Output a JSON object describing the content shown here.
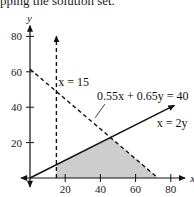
{
  "caption": "pping the solution set.",
  "chart_data": {
    "type": "area",
    "title": "",
    "xlabel": "x",
    "ylabel": "y",
    "xlim": [
      -5,
      90
    ],
    "ylim": [
      -5,
      90
    ],
    "xticks": [
      20,
      40,
      60,
      80
    ],
    "yticks": [
      20,
      40,
      60,
      80
    ],
    "xtick_labels": [
      "20",
      "40",
      "60",
      "80"
    ],
    "ytick_labels": [
      "20",
      "40",
      "60",
      "80"
    ],
    "grid": false,
    "lines": [
      {
        "name": "x = 15",
        "equation": "x = 15",
        "style": "dashed",
        "points": [
          [
            15,
            0
          ],
          [
            15,
            80
          ]
        ],
        "arrow": "end"
      },
      {
        "name": "0.55x + 0.65y = 40",
        "equation": "0.55x + 0.65y = 40",
        "style": "dashed",
        "points": [
          [
            0,
            61.54
          ],
          [
            72.73,
            0
          ]
        ]
      },
      {
        "name": "x = 2y",
        "equation": "x = 2y",
        "style": "solid",
        "points": [
          [
            0,
            0
          ],
          [
            82,
            41
          ]
        ],
        "arrow": "end"
      }
    ],
    "shaded_region": {
      "name": "solution set",
      "vertices": [
        [
          15,
          0
        ],
        [
          15,
          7.5
        ],
        [
          45.71,
          22.86
        ],
        [
          72.73,
          0
        ]
      ],
      "color": "#c8c8c8"
    },
    "annotations": [
      {
        "text": "x = 15",
        "anchor": [
          16,
          52
        ]
      },
      {
        "text": "0.55x + 0.65y = 40",
        "anchor": [
          38,
          44
        ]
      },
      {
        "text": "x = 2y",
        "anchor": [
          72,
          29
        ]
      }
    ]
  }
}
